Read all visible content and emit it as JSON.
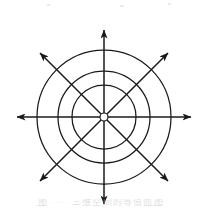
{
  "figure": {
    "title_top_fragment": "·· ····· ·· ····· ·· ·· ··",
    "caption_bottom_fragment": "图 ···· 三维空间的等值面图",
    "stroke_color": "#1a1a1a",
    "background_color": "#ffffff",
    "origin_label": "O"
  },
  "chart_data": {
    "type": "scatter",
    "title": "",
    "subtitle": "",
    "xlabel": "",
    "ylabel": "",
    "grid": true,
    "legend": "none",
    "coordinate_system": "polar",
    "center": {
      "x": 104,
      "y": 117
    },
    "circles": [
      {
        "name": "inner-circle",
        "radius": 32
      },
      {
        "name": "middle-circle",
        "radius": 46
      },
      {
        "name": "outer-circle",
        "radius": 67
      }
    ],
    "origin_marker": {
      "name": "origin-circle",
      "radius": 4
    },
    "axes": [
      {
        "name": "horizontal-axis",
        "angle_deg": 0,
        "length": 87,
        "arrows": "both"
      },
      {
        "name": "vertical-axis",
        "angle_deg": 90,
        "length": 87,
        "arrows": "both"
      },
      {
        "name": "diagonal-axis-a",
        "angle_deg": 45,
        "length": 87,
        "arrows": "both"
      },
      {
        "name": "diagonal-axis-b",
        "angle_deg": 135,
        "length": 87,
        "arrows": "both"
      }
    ],
    "ray_count": 8,
    "ray_angles_deg": [
      0,
      45,
      90,
      135,
      180,
      225,
      270,
      315
    ],
    "xlim": [
      -87,
      87
    ],
    "ylim": [
      -87,
      87
    ]
  }
}
